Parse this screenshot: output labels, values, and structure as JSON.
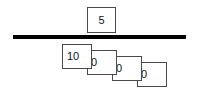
{
  "diagram": {
    "background_color": "#ffffff",
    "line_color": "#000000",
    "card_border_color": "#4a4a4a",
    "text_color": "#111111",
    "divider": {
      "name": "horizontal-rule",
      "thickness_px": 4
    },
    "top_group": {
      "label": "numerator-card",
      "cards": [
        {
          "value": "5"
        }
      ]
    },
    "bottom_group": {
      "label": "stacked-place-value-cards",
      "cards": [
        {
          "value": "10"
        },
        {
          "value": "0"
        },
        {
          "value": "0"
        },
        {
          "value": "0"
        }
      ]
    }
  }
}
